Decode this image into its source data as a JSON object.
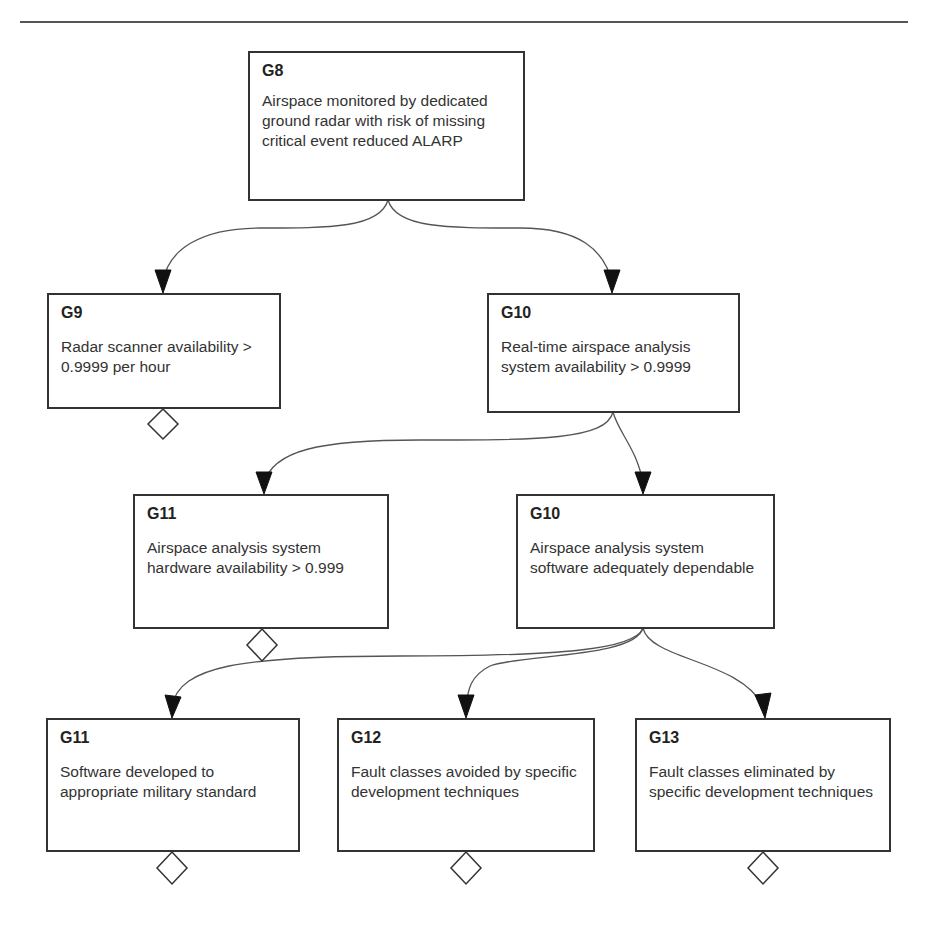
{
  "diagram": {
    "type": "goal-structure",
    "goals": [
      {
        "key": "g8",
        "id": "G8",
        "text": "Airspace monitored by dedicated ground radar with risk of missing critical event reduced ALARP",
        "undeveloped": false
      },
      {
        "key": "g9",
        "id": "G9",
        "text": "Radar scanner availability > 0.9999 per hour",
        "undeveloped": true
      },
      {
        "key": "g10a",
        "id": "G10",
        "text": "Real-time airspace analysis system availability > 0.9999",
        "undeveloped": false
      },
      {
        "key": "g11a",
        "id": "G11",
        "text": "Airspace analysis system hardware availability > 0.999",
        "undeveloped": true
      },
      {
        "key": "g10b",
        "id": "G10",
        "text": "Airspace analysis system software adequately dependable",
        "undeveloped": false
      },
      {
        "key": "g11b",
        "id": "G11",
        "text": "Software developed to appropriate military standard",
        "undeveloped": true
      },
      {
        "key": "g12",
        "id": "G12",
        "text": "Fault classes avoided by specific development techniques",
        "undeveloped": true
      },
      {
        "key": "g13",
        "id": "G13",
        "text": "Fault classes eliminated by specific development techniques",
        "undeveloped": true
      }
    ],
    "links": [
      {
        "from": "G8",
        "to": "G9"
      },
      {
        "from": "G8",
        "to": "G10 (Real-time airspace analysis system availability)"
      },
      {
        "from": "G10 (Real-time airspace analysis system availability)",
        "to": "G11 (hardware availability)"
      },
      {
        "from": "G10 (Real-time airspace analysis system availability)",
        "to": "G10 (software adequately dependable)"
      },
      {
        "from": "G10 (software adequately dependable)",
        "to": "G11 (military standard)"
      },
      {
        "from": "G10 (software adequately dependable)",
        "to": "G12"
      },
      {
        "from": "G10 (software adequately dependable)",
        "to": "G13"
      }
    ],
    "colors": {
      "line": "#555555",
      "border": "#333333",
      "arrow": "#111111"
    }
  }
}
